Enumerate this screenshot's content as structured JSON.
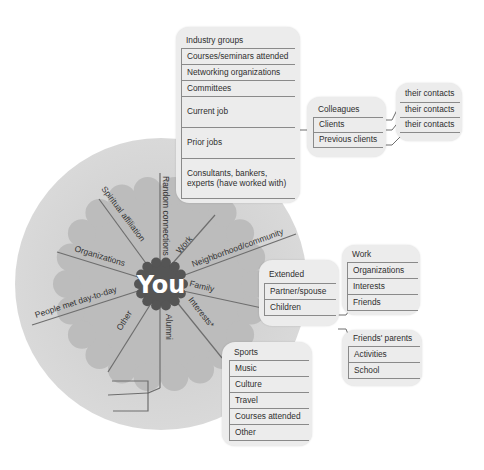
{
  "center": {
    "label": "You"
  },
  "spokes": [
    {
      "id": "random-connections",
      "label": "Random connections"
    },
    {
      "id": "work",
      "label": "Work"
    },
    {
      "id": "neighborhood",
      "label": "Neighborhood/community"
    },
    {
      "id": "family",
      "label": "Family"
    },
    {
      "id": "interests",
      "label": "Interests*"
    },
    {
      "id": "alumni",
      "label": "Alumni"
    },
    {
      "id": "other",
      "label": "Other"
    },
    {
      "id": "people-met",
      "label": "People met day-to-day"
    },
    {
      "id": "organizations",
      "label": "Organizations"
    },
    {
      "id": "spiritual",
      "label": "Spiritual affiliation"
    }
  ],
  "work_box": {
    "items": [
      "Industry groups",
      "Courses/seminars attended",
      "Networking organizations",
      "Committees",
      "Current job",
      "Prior jobs",
      "Consultants, bankers, experts (have worked with)"
    ]
  },
  "current_job_box": {
    "items": [
      "Colleagues",
      "Clients",
      "Previous clients"
    ]
  },
  "contacts_box": {
    "items": [
      "their contacts",
      "their contacts",
      "their contacts"
    ]
  },
  "family_box": {
    "items": [
      "Extended",
      "Partner/spouse",
      "Children"
    ]
  },
  "partner_box": {
    "items": [
      "Work",
      "Organizations",
      "Interests",
      "Friends"
    ]
  },
  "children_box": {
    "items": [
      "Friends' parents",
      "Activities",
      "School"
    ]
  },
  "interests_box": {
    "items": [
      "Sports",
      "Music",
      "Culture",
      "Travel",
      "Courses attended",
      "Other"
    ]
  },
  "colors": {
    "outer_circle": "#d3d3d3",
    "flower": "#bdbdbd",
    "center": "#555555",
    "box_fill": "#ececec",
    "lines": "#7a7a7a"
  }
}
